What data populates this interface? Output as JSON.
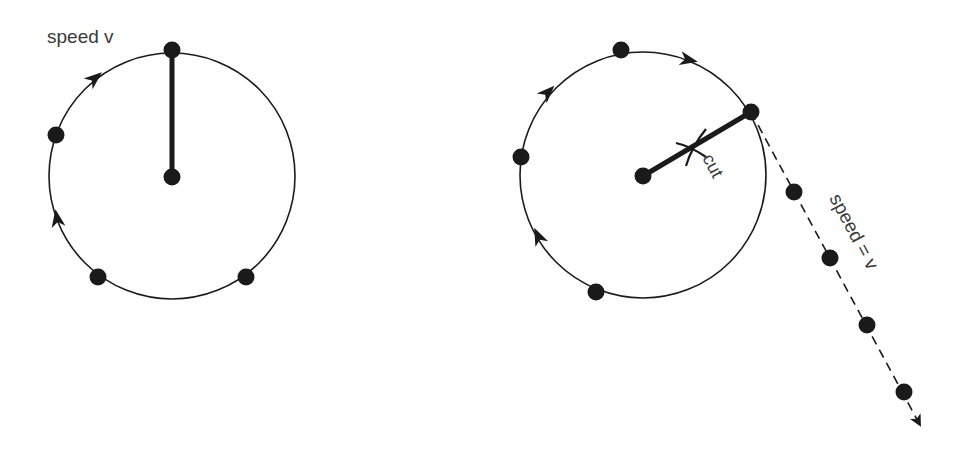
{
  "diagram": {
    "left_panel": {
      "label": "speed v",
      "circle": {
        "cx": 172,
        "cy": 176,
        "r": 123
      },
      "string": {
        "from": [
          172,
          176
        ],
        "to": [
          172,
          50
        ]
      },
      "masses": [
        [
          172,
          50
        ],
        [
          56,
          135
        ],
        [
          98,
          277
        ],
        [
          246,
          277
        ],
        [
          172,
          177
        ]
      ],
      "direction_arrows": [
        {
          "at": [
            95,
            78
          ],
          "angle": -40
        },
        {
          "at": [
            57,
            218
          ],
          "angle": -100
        }
      ]
    },
    "right_panel": {
      "cut_label": "cut",
      "tangent_label": "speed = v",
      "circle": {
        "cx": 643,
        "cy": 175,
        "r": 123
      },
      "string": {
        "from": [
          643,
          176
        ],
        "to": [
          751,
          112
        ]
      },
      "cut_mark_at": [
        690,
        148
      ],
      "masses_on_circle": [
        [
          621,
          50
        ],
        [
          521,
          157
        ],
        [
          596,
          292
        ],
        [
          751,
          112
        ],
        [
          643,
          176
        ]
      ],
      "masses_on_path": [
        [
          794,
          192
        ],
        [
          830,
          258
        ],
        [
          867,
          325
        ],
        [
          904,
          392
        ]
      ],
      "path_end": [
        921,
        427
      ],
      "direction_arrows": [
        {
          "at": [
            548,
            92
          ],
          "angle": -45
        },
        {
          "at": [
            689,
            60
          ],
          "angle": 12
        },
        {
          "at": [
            538,
            236
          ],
          "angle": -115
        }
      ]
    },
    "colors": {
      "ink": "#1a1a1a",
      "label": "#3a3a3a",
      "background": "#ffffff"
    }
  }
}
